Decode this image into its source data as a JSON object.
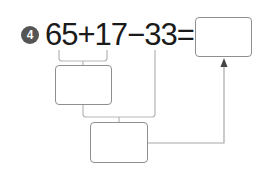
{
  "problem": {
    "number": "4",
    "expression": "65+17−33=",
    "terms": [
      "65",
      "+",
      "17",
      "−",
      "33",
      "="
    ]
  },
  "boxes": {
    "answer": "",
    "step1": "",
    "step2": ""
  },
  "colors": {
    "badge": "#555555",
    "text": "#1a1a1a",
    "box_border": "#8f8f8f",
    "line": "#b5b5b5"
  }
}
